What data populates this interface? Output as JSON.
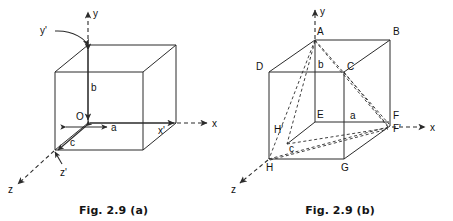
{
  "figure": {
    "panels": [
      {
        "id": "a",
        "caption": "Fig. 2.9 (a)",
        "axes": [
          {
            "name": "y-axis-label",
            "label": "y"
          },
          {
            "name": "x-axis-label",
            "label": "x"
          },
          {
            "name": "z-axis-label",
            "label": "z"
          },
          {
            "name": "y-prime-axis-label",
            "label": "y'"
          },
          {
            "name": "x-prime-axis-label",
            "label": "x'"
          },
          {
            "name": "z-prime-axis-label",
            "label": "z'"
          }
        ],
        "points": [
          {
            "name": "origin-label",
            "label": "O"
          }
        ],
        "dimensions": [
          {
            "name": "dimension-a",
            "label": "a"
          },
          {
            "name": "dimension-b",
            "label": "b"
          },
          {
            "name": "dimension-c",
            "label": "c"
          }
        ]
      },
      {
        "id": "b",
        "caption": "Fig. 2.9 (b)",
        "axes": [
          {
            "name": "y-axis-label",
            "label": "y"
          },
          {
            "name": "x-axis-label",
            "label": "x"
          },
          {
            "name": "z-axis-label",
            "label": "z"
          }
        ],
        "points": [
          {
            "name": "vertex-A",
            "label": "A"
          },
          {
            "name": "vertex-B",
            "label": "B"
          },
          {
            "name": "vertex-C",
            "label": "C"
          },
          {
            "name": "vertex-D",
            "label": "D"
          },
          {
            "name": "vertex-E",
            "label": "E"
          },
          {
            "name": "vertex-F",
            "label": "F"
          },
          {
            "name": "vertex-F-prime",
            "label": "F'"
          },
          {
            "name": "vertex-G",
            "label": "G"
          },
          {
            "name": "vertex-H",
            "label": "H"
          },
          {
            "name": "vertex-H-prime",
            "label": "H'"
          }
        ],
        "dimensions": [
          {
            "name": "dimension-a",
            "label": "a"
          },
          {
            "name": "dimension-b",
            "label": "b"
          },
          {
            "name": "dimension-c",
            "label": "c"
          }
        ]
      }
    ],
    "colors": {
      "line": "#2b2b2b",
      "text": "#111111",
      "background": "#ffffff"
    }
  }
}
